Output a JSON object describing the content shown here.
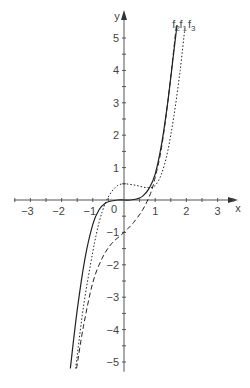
{
  "chart_data": {
    "type": "line",
    "title": "",
    "xlabel": "x",
    "ylabel": "y",
    "xlim": [
      -3.5,
      3.5
    ],
    "ylim": [
      -5.3,
      5.6
    ],
    "grid": false,
    "x_ticks": [
      -3,
      -2,
      -1,
      1,
      2,
      3
    ],
    "y_ticks": [
      -5,
      -4,
      -3,
      -2,
      -1,
      1,
      2,
      3,
      4,
      5
    ],
    "origin_label": "0",
    "series": [
      {
        "name": "f1",
        "style": "solid",
        "points": [
          [
            -1.72,
            -5.2
          ],
          [
            -1.5,
            -3.4
          ],
          [
            -1.25,
            -1.8
          ],
          [
            -1.0,
            -0.75
          ],
          [
            -0.8,
            -0.3
          ],
          [
            -0.6,
            -0.1
          ],
          [
            -0.4,
            -0.03
          ],
          [
            -0.2,
            0.0
          ],
          [
            0,
            0.0
          ],
          [
            0.2,
            0.0
          ],
          [
            0.4,
            0.03
          ],
          [
            0.6,
            0.12
          ],
          [
            0.8,
            0.35
          ],
          [
            1.0,
            0.8
          ],
          [
            1.2,
            1.7
          ],
          [
            1.4,
            3.0
          ],
          [
            1.6,
            4.6
          ],
          [
            1.7,
            5.4
          ]
        ]
      },
      {
        "name": "f2",
        "style": "dashed",
        "points": [
          [
            -1.52,
            -5.2
          ],
          [
            -1.3,
            -3.9
          ],
          [
            -1.0,
            -2.55
          ],
          [
            -0.7,
            -1.8
          ],
          [
            -0.4,
            -1.35
          ],
          [
            0,
            -1.0
          ],
          [
            0.3,
            -0.7
          ],
          [
            0.6,
            -0.3
          ],
          [
            0.85,
            0.2
          ],
          [
            1.0,
            0.7
          ],
          [
            1.2,
            1.6
          ],
          [
            1.4,
            3.0
          ],
          [
            1.6,
            4.7
          ],
          [
            1.68,
            5.4
          ]
        ]
      },
      {
        "name": "f3",
        "style": "dotted",
        "points": [
          [
            -1.55,
            -5.2
          ],
          [
            -1.3,
            -3.3
          ],
          [
            -1.0,
            -1.6
          ],
          [
            -0.8,
            -0.7
          ],
          [
            -0.6,
            -0.1
          ],
          [
            -0.4,
            0.25
          ],
          [
            -0.2,
            0.45
          ],
          [
            0,
            0.5
          ],
          [
            0.2,
            0.48
          ],
          [
            0.4,
            0.45
          ],
          [
            0.6,
            0.4
          ],
          [
            0.8,
            0.38
          ],
          [
            1.0,
            0.45
          ],
          [
            1.2,
            0.8
          ],
          [
            1.4,
            1.5
          ],
          [
            1.6,
            2.6
          ],
          [
            1.8,
            4.0
          ],
          [
            1.95,
            5.3
          ]
        ]
      }
    ],
    "legend": [
      {
        "label": "f2",
        "x": 1.55,
        "y": 5.45
      },
      {
        "label": "f1",
        "x": 1.78,
        "y": 5.45
      },
      {
        "label": "f3",
        "x": 2.05,
        "y": 5.45
      }
    ]
  }
}
